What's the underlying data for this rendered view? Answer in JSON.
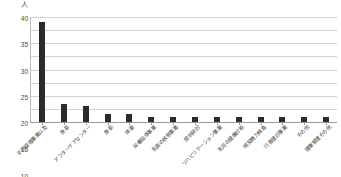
{
  "chart_data": {
    "type": "bar",
    "title": "",
    "subtitle": "",
    "xlabel": "",
    "ylabel": "人",
    "unit_label": "人",
    "ylim": [
      0,
      40
    ],
    "ytick_step": 5,
    "yticks": [
      "0",
      "5",
      "10",
      "15",
      "20",
      "25",
      "30",
      "35",
      "40"
    ],
    "grid": true,
    "legend": false,
    "legend_position": "none",
    "bar_color": "#2b2b2b",
    "categories": [
      "子防接種事業以及",
      "身長",
      "アフターケアセンター",
      "身長",
      "体重",
      "栄養指導事業",
      "乳歯の状態事業",
      "屈折研診",
      "リハビリテーション事業",
      "乳児の健康診断",
      "視覚聴力検査",
      "行音健診事業",
      "その他",
      "健康管理その他"
    ],
    "values": [
      38,
      7,
      6,
      3,
      3,
      2,
      2,
      2,
      2,
      2,
      2,
      2,
      2,
      2
    ]
  }
}
